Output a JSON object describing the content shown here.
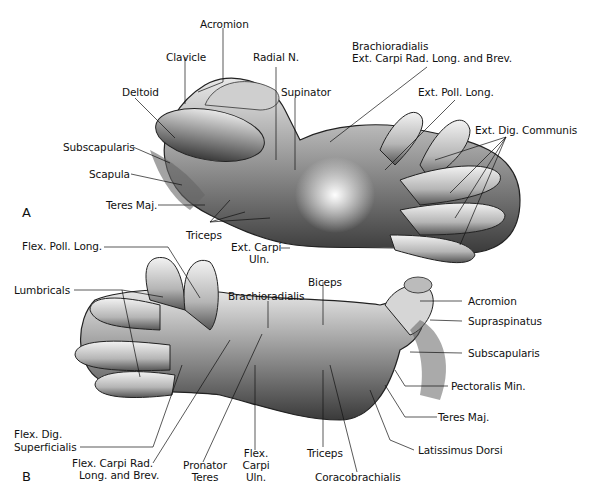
{
  "figure": {
    "panels": [
      {
        "id": "A",
        "letter": "A",
        "labels": {
          "acromion": "Acromion",
          "clavicle": "Clavicle",
          "radial_n": "Radial N.",
          "brachioradialis_1": "Brachioradialis",
          "brachioradialis_2": "Ext. Carpi Rad. Long. and Brev.",
          "deltoid": "Deltoid",
          "supinator": "Supinator",
          "ext_poll_long": "Ext. Poll. Long.",
          "ext_dig_communis": "Ext. Dig. Communis",
          "subscapularis": "Subscapularis",
          "scapula": "Scapula",
          "teres_maj": "Teres Maj.",
          "triceps": "Triceps",
          "ext_carpi_uln_1": "Ext. Carpi",
          "ext_carpi_uln_2": "Uln."
        }
      },
      {
        "id": "B",
        "letter": "B",
        "labels": {
          "flex_poll_long": "Flex. Poll. Long.",
          "lumbricals": "Lumbricals",
          "brachioradialis": "Brachioradialis",
          "biceps": "Biceps",
          "acromion": "Acromion",
          "supraspinatus": "Supraspinatus",
          "subscapularis": "Subscapularis",
          "pectoralis_min": "Pectoralis Min.",
          "teres_maj": "Teres Maj.",
          "latissimus_dorsi": "Latissimus Dorsi",
          "flex_dig_sup_1": "Flex. Dig.",
          "flex_dig_sup_2": "Superficialis",
          "flex_carpi_rad_1": "Flex. Carpi Rad.",
          "flex_carpi_rad_2": "Long. and Brev.",
          "pronator_teres_1": "Pronator",
          "pronator_teres_2": "Teres",
          "flex_carpi_uln_1": "Flex.",
          "flex_carpi_uln_2": "Carpi",
          "flex_carpi_uln_3": "Uln.",
          "triceps": "Triceps",
          "coracobrachialis": "Coracobrachialis"
        }
      }
    ]
  }
}
